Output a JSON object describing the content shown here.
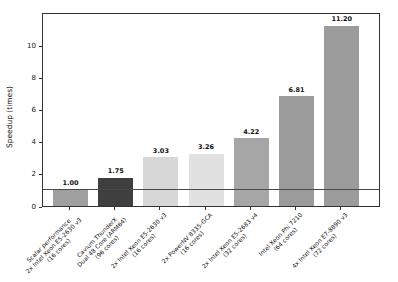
{
  "figure": {
    "background": "#ffffff",
    "frame_color": "#333333",
    "reference_line_color": "#4a4a4a"
  },
  "chart_data": {
    "type": "bar",
    "title": "",
    "xlabel": "",
    "ylabel": "Speedup (times)",
    "ylim": [
      0,
      12.05
    ],
    "yticks": [
      0,
      2,
      4,
      6,
      8,
      10
    ],
    "grid": false,
    "legend": null,
    "reference_line_y": 1.0,
    "categories": [
      [
        "Scalar performance",
        "2x Intel Xeon E5-2630 v3",
        "(16 cores)"
      ],
      [
        "Cavium ThunderX",
        "Dual 48 Core (ARM64)",
        "(96 cores)"
      ],
      [
        "2x Intel Xeon E5-2630 v3",
        "(16 cores)"
      ],
      [
        "2x PowerNV 8335-GCA",
        "(16 cores)"
      ],
      [
        "2x Intel Xeon E5-2683 v4",
        "(32 cores)"
      ],
      [
        "Intel Xeon Phi 7210",
        "(64 cores)"
      ],
      [
        "4x Intel Xeon E7-8890 v3",
        "(72 cores)"
      ]
    ],
    "values": [
      1.0,
      1.75,
      3.03,
      3.26,
      4.22,
      6.81,
      11.2
    ],
    "value_labels": [
      "1.00",
      "1.75",
      "3.03",
      "3.26",
      "4.22",
      "6.81",
      "11.20"
    ],
    "bar_colors": [
      "#9f9f9f",
      "#3f3f3f",
      "#d7d7d7",
      "#e1e1e1",
      "#a6a6a6",
      "#9b9b9b",
      "#9b9b9b"
    ]
  }
}
